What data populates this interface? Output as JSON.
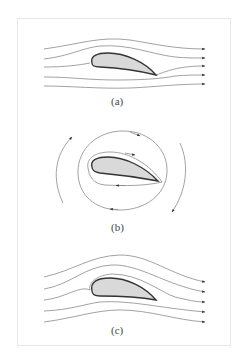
{
  "figure": {
    "panels": [
      {
        "id": "a",
        "label": "(a)",
        "description": "Uniform flow around airfoil with streamlines passing smoothly, no circulation"
      },
      {
        "id": "b",
        "label": "(b)",
        "description": "Pure circulation around airfoil with closed streamline loops"
      },
      {
        "id": "c",
        "label": "(c)",
        "description": "Combined flow: uniform flow plus circulation, streamlines deflected upward over airfoil"
      }
    ],
    "colors": {
      "airfoil_fill": "#d9d9d9",
      "airfoil_stroke": "#333333",
      "streamline": "#8a8a8a",
      "frame": "#e6e6e6"
    }
  }
}
